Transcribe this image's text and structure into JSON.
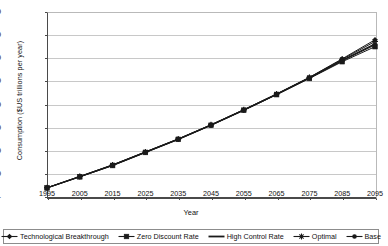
{
  "chart_data": {
    "type": "line",
    "title": "",
    "xlabel": "Year",
    "ylabel": "Consumption ($US trillions per year)",
    "x": [
      1995,
      2005,
      2015,
      2025,
      2035,
      2045,
      2055,
      2065,
      2075,
      2085,
      2095
    ],
    "xtick_labels": [
      "1995",
      "2005",
      "2015",
      "2025",
      "2035",
      "2045",
      "2055",
      "2065",
      "2075",
      "2085",
      "2095"
    ],
    "xlim": [
      1995,
      2095
    ],
    "ylim": [
      0,
      16
    ],
    "ytick_values": [
      0,
      2,
      4,
      6,
      8,
      10,
      12,
      14,
      16
    ],
    "ytick_labels": [
      "-",
      "2.00",
      "4.00",
      "6.00",
      "8.00",
      "10.00",
      "12.00",
      "14.00",
      "16.00"
    ],
    "grid": "horizontal",
    "legend_position": "bottom",
    "series": [
      {
        "name": "Technological Breakthrough",
        "marker": "diamond",
        "color": "#1a1a1a",
        "values": [
          0.8,
          1.78,
          2.78,
          3.9,
          5.02,
          6.25,
          7.55,
          8.92,
          10.35,
          11.95,
          13.6
        ]
      },
      {
        "name": "Zero Discount Rate",
        "marker": "square",
        "color": "#1a1a1a",
        "values": [
          0.78,
          1.74,
          2.72,
          3.85,
          4.98,
          6.2,
          7.5,
          8.85,
          10.25,
          11.7,
          13.0
        ]
      },
      {
        "name": "High Control Rate",
        "marker": "none",
        "color": "#1a1a1a",
        "values": [
          0.79,
          1.76,
          2.75,
          3.87,
          5.0,
          6.22,
          7.52,
          8.88,
          10.3,
          11.82,
          13.25
        ]
      },
      {
        "name": "Optimal",
        "marker": "asterisk",
        "color": "#1a1a1a",
        "values": [
          0.8,
          1.77,
          2.77,
          3.89,
          5.01,
          6.24,
          7.54,
          8.9,
          10.33,
          11.9,
          13.45
        ]
      },
      {
        "name": "Base",
        "marker": "circle",
        "color": "#1a1a1a",
        "values": [
          0.79,
          1.75,
          2.74,
          3.86,
          4.99,
          6.21,
          7.51,
          8.86,
          10.28,
          11.78,
          13.15
        ]
      }
    ]
  },
  "legend": {
    "items": [
      {
        "label": "Technological Breakthrough",
        "marker": "diamond"
      },
      {
        "label": "Zero Discount Rate",
        "marker": "square"
      },
      {
        "label": "High Control Rate",
        "marker": "none"
      },
      {
        "label": "Optimal",
        "marker": "asterisk"
      },
      {
        "label": "Base",
        "marker": "circle"
      }
    ]
  }
}
